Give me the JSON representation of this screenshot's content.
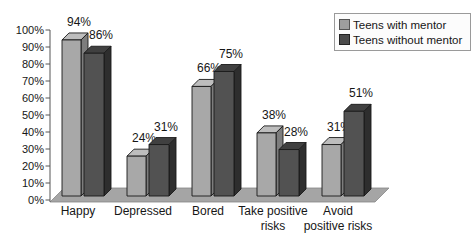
{
  "chart_data": {
    "type": "bar",
    "style": "3d-clustered",
    "title": "",
    "xlabel": "",
    "ylabel": "",
    "ylim": [
      0,
      100
    ],
    "ytick_step": 10,
    "ytick_labels": [
      "0%",
      "10%",
      "20%",
      "30%",
      "40%",
      "50%",
      "60%",
      "70%",
      "80%",
      "90%",
      "100%"
    ],
    "grid": false,
    "legend_position": "top-right",
    "categories": [
      "Happy",
      "Depressed",
      "Bored",
      "Take positive\nrisks",
      "Avoid\npositive risks"
    ],
    "series": [
      {
        "name": "Teens with mentor",
        "values": [
          94,
          24,
          66,
          38,
          31
        ],
        "labels": [
          "94%",
          "24%",
          "66%",
          "38%",
          "31%"
        ],
        "colors": {
          "front": "#a8a8a8",
          "top": "#bdbdbd",
          "side": "#7d7d7d",
          "swatch": "#9e9e9e"
        }
      },
      {
        "name": "Teens without mentor",
        "values": [
          86,
          31,
          75,
          28,
          51
        ],
        "labels": [
          "86%",
          "31%",
          "75%",
          "28%",
          "51%"
        ],
        "colors": {
          "front": "#525252",
          "top": "#404040",
          "side": "#2e2e2e",
          "swatch": "#4a4a4a"
        }
      }
    ],
    "floor_color": "#a5a5a5",
    "axis_color": "#555555",
    "outline_color": "#1a1a1a",
    "text_color": "#161616"
  }
}
